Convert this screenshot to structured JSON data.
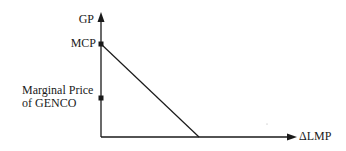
{
  "diagram": {
    "y_axis_label": "GP",
    "x_axis_label": "ΔLMP",
    "markers": [
      {
        "label": "MCP"
      },
      {
        "label_line1": "Marginal Price",
        "label_line2": "of GENCO"
      }
    ],
    "line": {
      "from": "MCP on GP axis",
      "to": "ΔLMP axis",
      "description": "GENCO profit decreases linearly with ΔLMP"
    }
  },
  "colors": {
    "ink": "#1a1a1a",
    "background": "#ffffff"
  }
}
